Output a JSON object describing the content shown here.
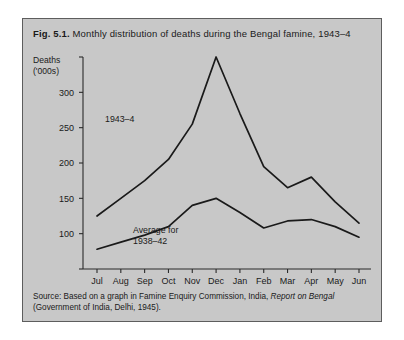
{
  "figure": {
    "label": "Fig. 5.1.",
    "caption": "Monthly distribution of deaths during the Bengal famine, 1943–4",
    "source_prefix": "Source: Based on a graph in Famine Enquiry Commission, India, ",
    "source_italic": "Report on Bengal",
    "source_suffix": "(Government of India, Delhi, 1945).",
    "panel_color": "#c8c8c8",
    "border_color": "#5d5d5d",
    "ink_color": "#1a1a1a"
  },
  "chart_data": {
    "type": "line",
    "title": "Monthly distribution of deaths during the Bengal famine, 1943–4",
    "xlabel": "",
    "ylabel": "Deaths ('000s)",
    "ylabel_line1": "Deaths",
    "ylabel_line2": "('000s)",
    "categories": [
      "Jul",
      "Aug",
      "Sep",
      "Oct",
      "Nov",
      "Dec",
      "Jan",
      "Feb",
      "Mar",
      "Apr",
      "May",
      "Jun"
    ],
    "x": [
      "Jul",
      "Aug",
      "Sep",
      "Oct",
      "Nov",
      "Dec",
      "Jan",
      "Feb",
      "Mar",
      "Apr",
      "May",
      "Jun"
    ],
    "ylim": [
      50,
      350
    ],
    "yticks": [
      50,
      100,
      150,
      200,
      250,
      300,
      350
    ],
    "ytick_labels": [
      "",
      "100",
      "150",
      "200",
      "250",
      "300",
      ""
    ],
    "grid": false,
    "legend": "inline-annotations",
    "series": [
      {
        "name": "1943–4",
        "annotation": "1943–4",
        "values": [
          125,
          150,
          175,
          205,
          255,
          350,
          270,
          195,
          165,
          180,
          145,
          115
        ]
      },
      {
        "name": "Average for 1938–42",
        "annotation_line1": "Average for",
        "annotation_line2": "1938–42",
        "values": [
          78,
          88,
          98,
          110,
          140,
          150,
          130,
          108,
          118,
          120,
          110,
          95
        ]
      }
    ]
  }
}
